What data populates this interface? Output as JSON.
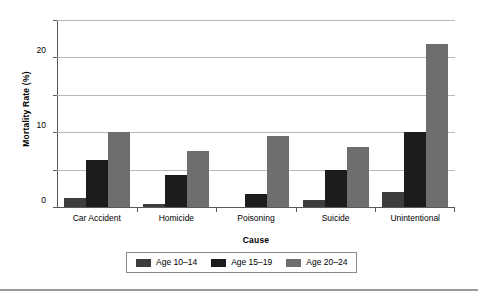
{
  "chart_data": {
    "type": "bar",
    "title": "",
    "xlabel": "Cause",
    "ylabel": "Mortality Rate (%)",
    "categories": [
      "Car Accident",
      "Homicide",
      "Poisoning",
      "Suicide",
      "Unintentional"
    ],
    "series": [
      {
        "name": "Age 10–14",
        "color": "#3d3d3d",
        "values": [
          2.5,
          0.7,
          0,
          2.0,
          4.0
        ]
      },
      {
        "name": "Age 15–19",
        "color": "#1c1c1c",
        "values": [
          12.5,
          8.5,
          3.5,
          10.0,
          20.0
        ]
      },
      {
        "name": "Age 20–24",
        "color": "#6e6e6e",
        "values": [
          20.0,
          15.0,
          19.0,
          16.0,
          43.5
        ]
      }
    ],
    "ylim": [
      0,
      50
    ],
    "yticks": [
      0,
      10,
      20,
      30,
      40,
      50
    ],
    "ytick_labels": [
      "0",
      "10",
      "20",
      "30",
      "40",
      "50"
    ],
    "grid": true,
    "legend_position": "bottom"
  },
  "colors": {
    "axis": "#595959",
    "gridline": "#b9b9b9",
    "legend_border": "#8a8a8a",
    "bottom_rule": "#9a9a9a",
    "background": "#ffffff"
  }
}
